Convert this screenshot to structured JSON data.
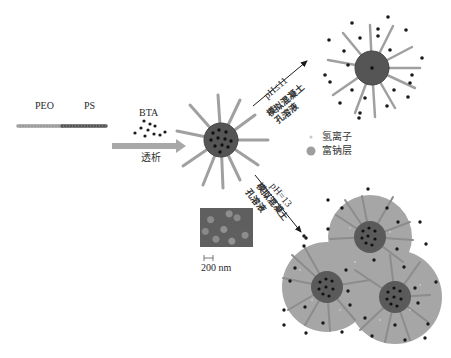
{
  "diagram": {
    "polymer": {
      "block1_label": "PEO",
      "block2_label": "PS",
      "block1_color": "#9a9a9a",
      "block2_color": "#555555"
    },
    "inhibitor": {
      "label": "BTA",
      "dot_color": "#1a1a1a"
    },
    "process": {
      "step1_label": "透析",
      "arrow_color": "#a8a8a8"
    },
    "branch_low_ph": {
      "condition": "pH≤11",
      "medium_line1": "模拟混凝土",
      "medium_line2": "孔溶液"
    },
    "branch_high_ph": {
      "condition": "pH=13",
      "medium_line1": "模拟混凝土",
      "medium_line2": "孔溶液"
    },
    "legend": [
      {
        "symbol": "small-light-dot",
        "label": "氢离子",
        "color": "#c8c8c8"
      },
      {
        "symbol": "large-gray-circle",
        "label": "富钠层",
        "color": "#9e9e9e"
      }
    ],
    "sem_image": {
      "scale_bar_label": "200 nm"
    },
    "colors": {
      "core": "#555555",
      "spoke": "#a0a0a0",
      "sodium_layer": "#a6a6a6",
      "dot": "#1a1a1a",
      "arrow_black": "#1a1a1a"
    }
  }
}
